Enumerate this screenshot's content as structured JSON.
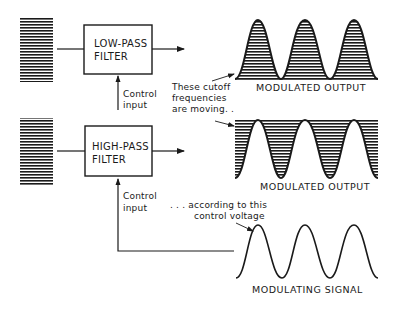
{
  "diagram": {
    "type": "voltage-controlled filter modulation",
    "low_pass": {
      "title_line1": "LOW-PASS",
      "title_line2": "FILTER",
      "control_line1": "Control",
      "control_line2": "input",
      "output_caption": "MODULATED OUTPUT"
    },
    "high_pass": {
      "title_line1": "HIGH-PASS",
      "title_line2": "FILTER",
      "control_line1": "Control",
      "control_line2": "input",
      "output_caption": "MODULATED OUTPUT"
    },
    "annotations": {
      "cutoff_line1": "These cutoff",
      "cutoff_line2": "frequencies",
      "cutoff_line3": "are moving. .",
      "control_line1": ". . . according to this",
      "control_line2": "control voltage"
    },
    "modulating": {
      "caption": "MODULATING SIGNAL",
      "cycles": 3
    },
    "colors": {
      "ink": "#1a1a1a",
      "background": "#ffffff"
    }
  }
}
